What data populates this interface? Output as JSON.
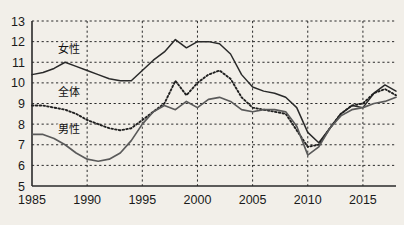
{
  "chart_data": {
    "type": "line",
    "title": "",
    "xlabel": "",
    "ylabel": "",
    "xlim": [
      1985,
      2018
    ],
    "ylim": [
      5,
      13
    ],
    "grid": true,
    "legend_position": "inline-labels",
    "x_ticks": [
      "1985",
      "1990",
      "1995",
      "2000",
      "2005",
      "2010",
      "2015"
    ],
    "x_tick_values": [
      1985,
      1990,
      1995,
      2000,
      2005,
      2010,
      2015
    ],
    "y_ticks": [
      "5",
      "6",
      "7",
      "8",
      "9",
      "10",
      "11",
      "12",
      "13"
    ],
    "y_tick_values": [
      5,
      6,
      7,
      8,
      9,
      10,
      11,
      12,
      13
    ],
    "x": [
      1985,
      1986,
      1987,
      1988,
      1989,
      1990,
      1991,
      1992,
      1993,
      1994,
      1995,
      1996,
      1997,
      1998,
      1999,
      2000,
      2001,
      2002,
      2003,
      2004,
      2005,
      2006,
      2007,
      2008,
      2009,
      2010,
      2011,
      2012,
      2013,
      2014,
      2015,
      2016,
      2017,
      2018
    ],
    "series": [
      {
        "name": "女性",
        "style": "solid",
        "color": "#2a2a2a",
        "values": [
          10.4,
          10.5,
          10.7,
          11.0,
          10.8,
          10.6,
          10.4,
          10.2,
          10.1,
          10.1,
          10.6,
          11.1,
          11.5,
          12.1,
          11.7,
          12.0,
          12.0,
          11.9,
          11.4,
          10.4,
          9.8,
          9.6,
          9.5,
          9.3,
          8.8,
          7.6,
          7.1,
          7.8,
          8.5,
          8.9,
          8.8,
          9.5,
          9.9,
          9.6
        ]
      },
      {
        "name": "全体",
        "style": "dotted",
        "color": "#1f1f1f",
        "values": [
          8.9,
          8.9,
          8.8,
          8.7,
          8.5,
          8.2,
          8.0,
          7.8,
          7.7,
          7.8,
          8.2,
          8.6,
          9.0,
          10.1,
          9.4,
          10.0,
          10.4,
          10.6,
          10.2,
          9.3,
          8.8,
          8.7,
          8.6,
          8.5,
          7.7,
          6.9,
          7.0,
          7.8,
          8.5,
          8.9,
          9.0,
          9.5,
          9.7,
          9.4
        ]
      },
      {
        "name": "男性",
        "style": "solid-gray",
        "color": "#5a5a5a",
        "values": [
          7.5,
          7.5,
          7.3,
          7.0,
          6.6,
          6.3,
          6.2,
          6.3,
          6.6,
          7.2,
          8.0,
          8.6,
          8.9,
          8.7,
          9.1,
          8.8,
          9.2,
          9.3,
          9.1,
          8.7,
          8.6,
          8.7,
          8.7,
          8.6,
          7.9,
          6.5,
          6.9,
          7.8,
          8.4,
          8.7,
          8.8,
          9.0,
          9.1,
          9.3
        ]
      }
    ],
    "series_label_positions": [
      {
        "name": "女性",
        "x": 1987.4,
        "y": 11.45
      },
      {
        "name": "全体",
        "x": 1987.4,
        "y": 9.35
      },
      {
        "name": "男性",
        "x": 1987.4,
        "y": 7.55
      }
    ]
  },
  "colors": {
    "background": "#f2efe9",
    "axis": "#2a2a2a",
    "grid": "#2b2b2b",
    "female": "#2a2a2a",
    "total": "#1f1f1f",
    "male": "#5a5a5a"
  }
}
